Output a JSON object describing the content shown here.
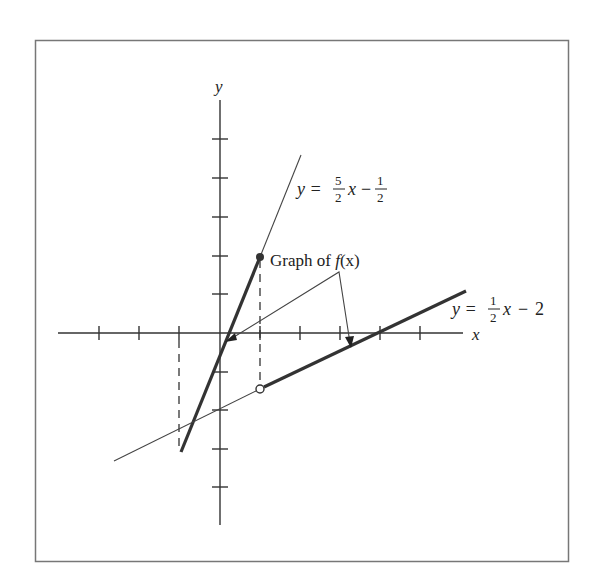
{
  "figure": {
    "axes": {
      "x_label": "x",
      "y_label": "y",
      "x_ticks": [
        -3,
        -2,
        -1,
        1,
        2,
        3,
        4,
        5
      ],
      "y_ticks": [
        -4,
        -3,
        -2,
        -1,
        1,
        2,
        3,
        4,
        5
      ]
    },
    "lines": [
      {
        "name": "line-1",
        "equation_prefix": "y =",
        "coef_num": "5",
        "coef_den": "2",
        "variable": "x",
        "minus": "−",
        "const_num": "1",
        "const_den": "2",
        "slope": 2.5,
        "intercept": -0.5,
        "thick_domain": [
          -1,
          1
        ],
        "endpoint": {
          "x": 1,
          "y": 2,
          "style": "filled"
        }
      },
      {
        "name": "line-2",
        "equation_prefix": "y =",
        "coef_num": "1",
        "coef_den": "2",
        "variable": "x",
        "minus": "−",
        "const": "2",
        "slope": 0.5,
        "intercept": -2,
        "thick_domain": [
          1,
          6
        ],
        "endpoint": {
          "x": 1,
          "y": -1.5,
          "style": "open"
        }
      }
    ],
    "callout": {
      "text_prefix": "Graph of ",
      "func": "f",
      "arg": "(x)"
    }
  }
}
